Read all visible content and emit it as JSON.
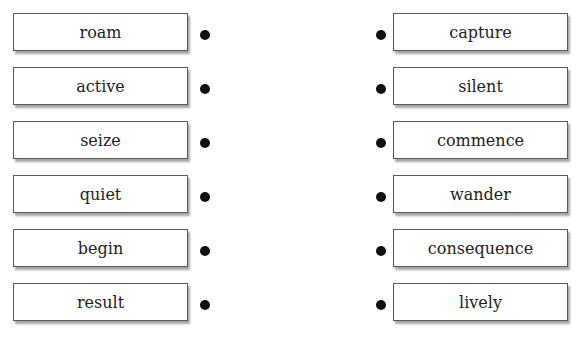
{
  "exercise": {
    "type": "matching",
    "left_column": {
      "items": [
        {
          "label": "roam"
        },
        {
          "label": "active"
        },
        {
          "label": "seize"
        },
        {
          "label": "quiet"
        },
        {
          "label": "begin"
        },
        {
          "label": "result"
        }
      ]
    },
    "right_column": {
      "items": [
        {
          "label": "capture"
        },
        {
          "label": "silent"
        },
        {
          "label": "commence"
        },
        {
          "label": "wander"
        },
        {
          "label": "consequence"
        },
        {
          "label": "lively"
        }
      ]
    }
  },
  "style": {
    "border_color": "#5a5a5a",
    "dot_color": "#111111",
    "background": "#ffffff"
  }
}
